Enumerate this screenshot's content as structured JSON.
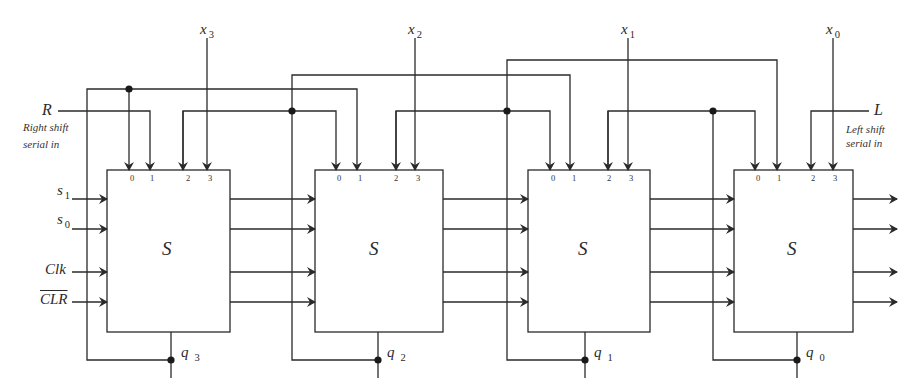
{
  "diagram": {
    "type": "4-bit universal shift register (bidirectional, parallel load)",
    "block_label": "S",
    "pin_labels": [
      "0",
      "1",
      "2",
      "3"
    ],
    "blocks": [
      {
        "id": "stage3",
        "name": "S",
        "output": "q",
        "output_sub": "3",
        "parallel_input": "x",
        "parallel_input_sub": "3"
      },
      {
        "id": "stage2",
        "name": "S",
        "output": "q",
        "output_sub": "2",
        "parallel_input": "x",
        "parallel_input_sub": "2"
      },
      {
        "id": "stage1",
        "name": "S",
        "output": "q",
        "output_sub": "1",
        "parallel_input": "x",
        "parallel_input_sub": "1"
      },
      {
        "id": "stage0",
        "name": "S",
        "output": "q",
        "output_sub": "0",
        "parallel_input": "x",
        "parallel_input_sub": "0"
      }
    ],
    "control_inputs": [
      {
        "label": "s",
        "sub": "1"
      },
      {
        "label": "s",
        "sub": "0"
      },
      {
        "label": "Clk",
        "sub": ""
      },
      {
        "label": "CLR",
        "sub": "",
        "overline": true
      }
    ],
    "serial_inputs": {
      "right": {
        "label": "R",
        "note_line1": "Right shift",
        "note_line2": "serial in"
      },
      "left": {
        "label": "L",
        "note_line1": "Left shift",
        "note_line2": "serial in"
      }
    },
    "colors": {
      "line": "#2a2a2a",
      "background": "#ffffff"
    }
  }
}
